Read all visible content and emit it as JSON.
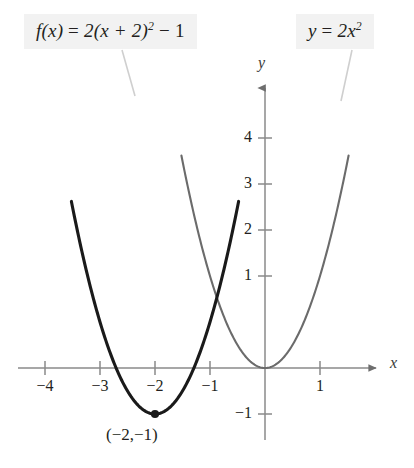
{
  "figure": {
    "type": "math-graph",
    "background": "#ffffff",
    "width": 414,
    "height": 468
  },
  "labels": {
    "f_label": {
      "lhs": "f(x)",
      "eq": " = ",
      "rhs_a": "2(x + 2)",
      "rhs_exp": "2",
      "rhs_b": " − 1",
      "full": "f(x) = 2(x + 2)² − 1"
    },
    "y_label": {
      "lhs": "y",
      "eq": " = ",
      "rhs_a": "2x",
      "rhs_exp": "2",
      "full": "y = 2x²"
    },
    "vertex_point": "(−2,−1)"
  },
  "axes": {
    "x_name": "x",
    "y_name": "y",
    "x_ticks": [
      {
        "value": -4,
        "label": "−4"
      },
      {
        "value": -3,
        "label": "−3"
      },
      {
        "value": -2,
        "label": "−2"
      },
      {
        "value": -1,
        "label": "−1"
      },
      {
        "value": 1,
        "label": "1"
      }
    ],
    "y_ticks": [
      {
        "value": 4,
        "label": "4"
      },
      {
        "value": 3,
        "label": "3"
      },
      {
        "value": 2,
        "label": "2"
      },
      {
        "value": 1,
        "label": "1"
      },
      {
        "value": -1,
        "label": "−1"
      }
    ],
    "color": "#808080"
  },
  "chart_data": {
    "type": "line",
    "title": "",
    "xlabel": "x",
    "ylabel": "y",
    "xlim": [
      -4.6,
      1.9
    ],
    "ylim": [
      -1.9,
      5.6
    ],
    "grid": false,
    "legend": "inline-callout-labels",
    "origin_px": [
      265,
      368
    ],
    "scale_px_per_unit": {
      "x": 55,
      "y": 46
    },
    "series": [
      {
        "name": "f(x) = 2(x + 2)² − 1",
        "expression": "2*(x+2)^2 - 1",
        "color": "#1a1a1a",
        "width": 3.1,
        "vertex": [
          -2,
          -1
        ],
        "x_domain": [
          -3.52,
          -0.48
        ],
        "points": [
          {
            "x": -3.52,
            "y": 3.63
          },
          {
            "x": -3.25,
            "y": 2.13
          },
          {
            "x": -3.0,
            "y": 1.0
          },
          {
            "x": -2.75,
            "y": 0.125
          },
          {
            "x": -2.5,
            "y": -0.5
          },
          {
            "x": -2.25,
            "y": -0.875
          },
          {
            "x": -2.0,
            "y": -1.0
          },
          {
            "x": -1.75,
            "y": -0.875
          },
          {
            "x": -1.5,
            "y": -0.5
          },
          {
            "x": -1.25,
            "y": 0.125
          },
          {
            "x": -1.0,
            "y": 1.0
          },
          {
            "x": -0.75,
            "y": 2.125
          },
          {
            "x": -0.48,
            "y": 3.63
          }
        ]
      },
      {
        "name": "y = 2x²",
        "expression": "2*x^2",
        "color": "#6b6b6b",
        "width": 2.1,
        "vertex": [
          0,
          0
        ],
        "x_domain": [
          -1.52,
          1.52
        ],
        "points": [
          {
            "x": -1.52,
            "y": 4.62
          },
          {
            "x": -1.25,
            "y": 3.125
          },
          {
            "x": -1.0,
            "y": 2.0
          },
          {
            "x": -0.75,
            "y": 1.125
          },
          {
            "x": -0.5,
            "y": 0.5
          },
          {
            "x": -0.25,
            "y": 0.125
          },
          {
            "x": 0.0,
            "y": 0.0
          },
          {
            "x": 0.25,
            "y": 0.125
          },
          {
            "x": 0.5,
            "y": 0.5
          },
          {
            "x": 0.75,
            "y": 1.125
          },
          {
            "x": 1.0,
            "y": 2.0
          },
          {
            "x": 1.25,
            "y": 3.125
          },
          {
            "x": 1.52,
            "y": 4.62
          }
        ]
      }
    ],
    "annotations": [
      {
        "name": "vertex-dot",
        "at": [
          -2,
          -1
        ],
        "label": "(−2,−1)"
      }
    ]
  }
}
